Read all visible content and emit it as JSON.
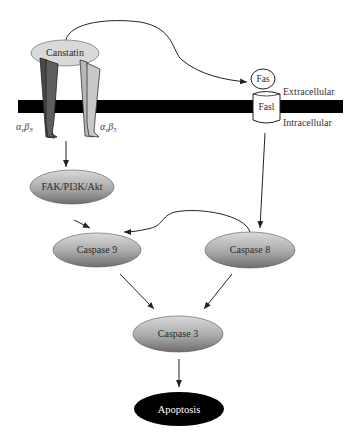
{
  "diagram": {
    "colors": {
      "membrane": "#000000",
      "node_gradient_light": "#d8d8d8",
      "node_gradient_dark": "#7a7a7a",
      "canstatin_fill": "#d9d9d9",
      "integrin_dark": "#555555",
      "integrin_light": "#bdbdbd",
      "apoptosis_fill": "#000000",
      "edge": "#222222"
    },
    "membrane": {
      "extracellular_label": "Extracellular",
      "intracellular_label": "Intracellular"
    },
    "ligand": {
      "id": "canstatin",
      "label": "Canstatin"
    },
    "receptors": [
      {
        "id": "avb3",
        "alpha": "α",
        "alpha_sub": "v",
        "beta": "β",
        "beta_sub": "3",
        "shade": "dark"
      },
      {
        "id": "avb5",
        "alpha": "α",
        "alpha_sub": "v",
        "beta": "β",
        "beta_sub": "5",
        "shade": "light"
      }
    ],
    "fas": {
      "receptor_label": "Fas",
      "ligand_label": "Fasl"
    },
    "nodes": [
      {
        "id": "fak",
        "label": "FAK/PI3K/Akt"
      },
      {
        "id": "casp9",
        "label": "Caspase 9"
      },
      {
        "id": "casp8",
        "label": "Caspase 8"
      },
      {
        "id": "casp3",
        "label": "Caspase 3"
      },
      {
        "id": "apoptosis",
        "label": "Apoptosis"
      }
    ],
    "edges": [
      {
        "from": "canstatin",
        "to": "fas"
      },
      {
        "from": "avb3",
        "to": "fak"
      },
      {
        "from": "fak",
        "to": "casp9"
      },
      {
        "from": "fasl",
        "to": "casp8"
      },
      {
        "from": "casp8",
        "to": "casp9"
      },
      {
        "from": "casp9",
        "to": "casp3"
      },
      {
        "from": "casp8",
        "to": "casp3"
      },
      {
        "from": "casp3",
        "to": "apoptosis"
      }
    ]
  }
}
